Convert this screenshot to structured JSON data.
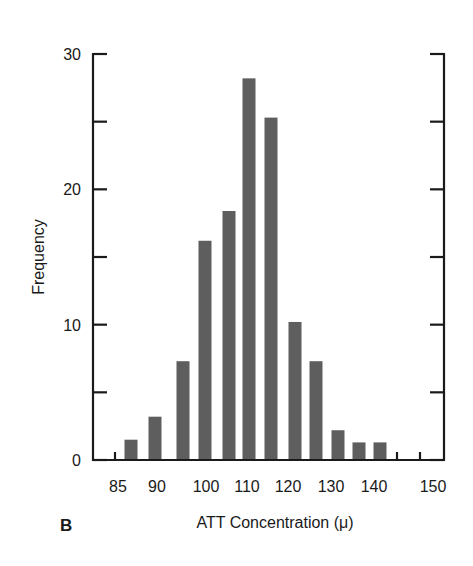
{
  "chart_data": {
    "type": "bar",
    "title": "",
    "panel_label": "B",
    "xlabel": "ATT Concentration (μ)",
    "ylabel": "Frequency",
    "ylim": [
      0,
      30
    ],
    "yticks": [
      0,
      10,
      20,
      30
    ],
    "yminor_ticks": [
      5,
      15,
      25
    ],
    "xlim": [
      82,
      152
    ],
    "xtick_labels": [
      "85",
      "90",
      "100",
      "110",
      "120",
      "130",
      "140",
      "150"
    ],
    "grid": false,
    "legend": null,
    "categories": [
      "87.5",
      "92.5",
      "97.5",
      "102.5",
      "107.5",
      "112.5",
      "117.5",
      "122.5",
      "127.5",
      "132.5",
      "137.5",
      "142.5"
    ],
    "values": [
      1.5,
      3.2,
      7.3,
      16.2,
      18.4,
      28.2,
      25.3,
      10.2,
      7.3,
      2.2,
      1.3,
      1.3
    ],
    "bar_color": "#5e5e5e"
  },
  "layout": {
    "plot_left": 93,
    "plot_right": 444,
    "plot_top": 54,
    "plot_bottom": 460,
    "bar_centers_px": [
      131,
      155,
      183,
      205,
      229,
      249,
      271,
      295,
      316,
      338,
      359,
      380
    ],
    "bar_width_px": 13,
    "xtick_label_px": [
      118,
      157,
      206,
      247,
      288,
      331,
      374,
      433
    ],
    "bottom_tick_px": [
      115,
      397,
      420
    ]
  }
}
